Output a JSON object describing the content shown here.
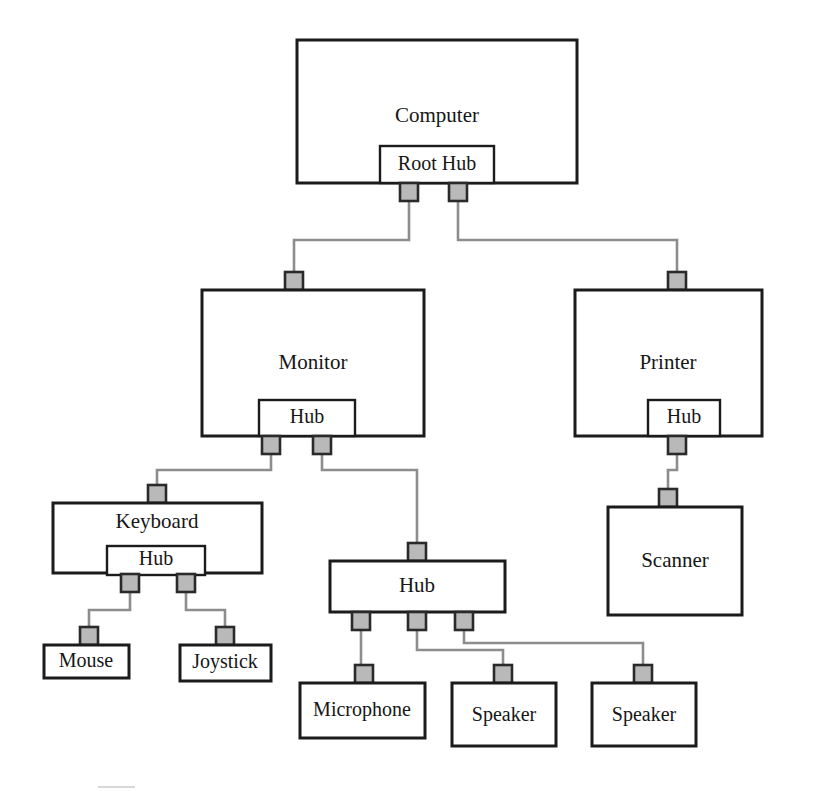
{
  "diagram": {
    "type": "usb-tiered-star-topology",
    "colors": {
      "box_stroke": "#1b1b1b",
      "box_fill": "#ffffff",
      "port_fill": "#b9b9b9",
      "port_stroke": "#2a2a2a",
      "wire": "#8d8d8d",
      "text": "#161616",
      "background": "#ffffff"
    },
    "nodes": [
      {
        "id": "computer",
        "label": "Computer",
        "tier": 0,
        "box": {
          "x": 297,
          "y": 40,
          "w": 280,
          "h": 143
        },
        "label_pos": {
          "x": 437,
          "y": 117
        },
        "hub": {
          "label": "Root Hub",
          "box": {
            "x": 380,
            "y": 146,
            "w": 114,
            "h": 37
          },
          "label_pos": {
            "x": 437,
            "y": 165
          }
        },
        "downstream_ports": [
          {
            "id": "root-hub-port-1",
            "x": 400,
            "y": 183
          },
          {
            "id": "root-hub-port-2",
            "x": 449,
            "y": 183
          }
        ]
      },
      {
        "id": "monitor",
        "label": "Monitor",
        "tier": 1,
        "box": {
          "x": 202,
          "y": 290,
          "w": 222,
          "h": 146
        },
        "label_pos": {
          "x": 313,
          "y": 364
        },
        "upstream_port": {
          "id": "monitor-upstream-port",
          "x": 285,
          "y": 272
        },
        "hub": {
          "label": "Hub",
          "box": {
            "x": 259,
            "y": 400,
            "w": 96,
            "h": 36
          },
          "label_pos": {
            "x": 307,
            "y": 418
          }
        },
        "downstream_ports": [
          {
            "id": "monitor-hub-port-1",
            "x": 262,
            "y": 436
          },
          {
            "id": "monitor-hub-port-2",
            "x": 313,
            "y": 436
          }
        ]
      },
      {
        "id": "printer",
        "label": "Printer",
        "tier": 1,
        "box": {
          "x": 575,
          "y": 290,
          "w": 187,
          "h": 146
        },
        "label_pos": {
          "x": 668,
          "y": 364
        },
        "upstream_port": {
          "id": "printer-upstream-port",
          "x": 668,
          "y": 272
        },
        "hub": {
          "label": "Hub",
          "box": {
            "x": 648,
            "y": 400,
            "w": 72,
            "h": 36
          },
          "label_pos": {
            "x": 684,
            "y": 418
          }
        },
        "downstream_ports": [
          {
            "id": "printer-hub-port-1",
            "x": 668,
            "y": 436
          }
        ]
      },
      {
        "id": "keyboard",
        "label": "Keyboard",
        "tier": 2,
        "box": {
          "x": 53,
          "y": 503,
          "w": 209,
          "h": 70
        },
        "label_pos": {
          "x": 157,
          "y": 523
        },
        "upstream_port": {
          "id": "keyboard-upstream-port",
          "x": 148,
          "y": 485
        },
        "hub": {
          "label": "Hub",
          "box": {
            "x": 107,
            "y": 546,
            "w": 98,
            "h": 29
          },
          "label_pos": {
            "x": 156,
            "y": 560
          }
        },
        "downstream_ports": [
          {
            "id": "keyboard-hub-port-1",
            "x": 121,
            "y": 574
          },
          {
            "id": "keyboard-hub-port-2",
            "x": 177,
            "y": 574
          }
        ]
      },
      {
        "id": "hub-standalone",
        "label": "Hub",
        "tier": 2,
        "box": {
          "x": 330,
          "y": 561,
          "w": 175,
          "h": 51
        },
        "label_pos": {
          "x": 417,
          "y": 587
        },
        "upstream_port": {
          "id": "hub-standalone-upstream-port",
          "x": 408,
          "y": 543
        },
        "downstream_ports": [
          {
            "id": "hub-standalone-port-1",
            "x": 352,
            "y": 612
          },
          {
            "id": "hub-standalone-port-2",
            "x": 408,
            "y": 612
          },
          {
            "id": "hub-standalone-port-3",
            "x": 455,
            "y": 612
          }
        ]
      },
      {
        "id": "scanner",
        "label": "Scanner",
        "tier": 2,
        "box": {
          "x": 608,
          "y": 507,
          "w": 134,
          "h": 108
        },
        "label_pos": {
          "x": 675,
          "y": 562
        },
        "upstream_port": {
          "id": "scanner-upstream-port",
          "x": 659,
          "y": 489
        }
      },
      {
        "id": "mouse",
        "label": "Mouse",
        "tier": 3,
        "box": {
          "x": 44,
          "y": 645,
          "w": 85,
          "h": 33
        },
        "label_pos": {
          "x": 86,
          "y": 662
        },
        "upstream_port": {
          "id": "mouse-upstream-port",
          "x": 80,
          "y": 627
        }
      },
      {
        "id": "joystick",
        "label": "Joystick",
        "tier": 3,
        "box": {
          "x": 180,
          "y": 645,
          "w": 91,
          "h": 36
        },
        "label_pos": {
          "x": 225,
          "y": 663
        },
        "upstream_port": {
          "id": "joystick-upstream-port",
          "x": 216,
          "y": 627
        }
      },
      {
        "id": "microphone",
        "label": "Microphone",
        "tier": 3,
        "box": {
          "x": 300,
          "y": 683,
          "w": 125,
          "h": 55
        },
        "label_pos": {
          "x": 362,
          "y": 711
        },
        "upstream_port": {
          "id": "microphone-upstream-port",
          "x": 355,
          "y": 665
        }
      },
      {
        "id": "speaker-1",
        "label": "Speaker",
        "tier": 3,
        "box": {
          "x": 452,
          "y": 683,
          "w": 104,
          "h": 63
        },
        "label_pos": {
          "x": 504,
          "y": 716
        },
        "upstream_port": {
          "id": "speaker-1-upstream-port",
          "x": 494,
          "y": 665
        }
      },
      {
        "id": "speaker-2",
        "label": "Speaker",
        "tier": 3,
        "box": {
          "x": 592,
          "y": 683,
          "w": 104,
          "h": 63
        },
        "label_pos": {
          "x": 644,
          "y": 716
        },
        "upstream_port": {
          "id": "speaker-2-upstream-port",
          "x": 634,
          "y": 665
        }
      }
    ],
    "connections": [
      {
        "id": "wire-roothub-to-monitor",
        "from": "root-hub-port-1",
        "to": "monitor-upstream-port",
        "path": "M 409 201 L 409 240 L 294 240 L 294 272"
      },
      {
        "id": "wire-roothub-to-printer",
        "from": "root-hub-port-2",
        "to": "printer-upstream-port",
        "path": "M 458 201 L 458 240 L 677 240 L 677 272"
      },
      {
        "id": "wire-monitorhub-to-keyboard",
        "from": "monitor-hub-port-1",
        "to": "keyboard-upstream-port",
        "path": "M 271 454 L 271 470 L 157 470 L 157 485"
      },
      {
        "id": "wire-monitorhub-to-hub",
        "from": "monitor-hub-port-2",
        "to": "hub-standalone-upstream-port",
        "path": "M 322 454 L 322 470 L 417 470 L 417 543"
      },
      {
        "id": "wire-printerhub-to-scanner",
        "from": "printer-hub-port-1",
        "to": "scanner-upstream-port",
        "path": "M 677 454 L 677 470 L 668 470 L 668 489"
      },
      {
        "id": "wire-keyboardhub-to-mouse",
        "from": "keyboard-hub-port-1",
        "to": "mouse-upstream-port",
        "path": "M 130 592 L 130 610 L 89 610 L 89 627"
      },
      {
        "id": "wire-keyboardhub-to-joystick",
        "from": "keyboard-hub-port-2",
        "to": "joystick-upstream-port",
        "path": "M 186 592 L 186 610 L 225 610 L 225 627"
      },
      {
        "id": "wire-hub-to-microphone",
        "from": "hub-standalone-port-1",
        "to": "microphone-upstream-port",
        "path": "M 361 630 L 361 665"
      },
      {
        "id": "wire-hub-to-speaker-1",
        "from": "hub-standalone-port-2",
        "to": "speaker-1-upstream-port",
        "path": "M 417 630 L 417 650 L 503 650 L 503 665"
      },
      {
        "id": "wire-hub-to-speaker-2",
        "from": "hub-standalone-port-3",
        "to": "speaker-2-upstream-port",
        "path": "M 464 630 L 464 643 L 643 643 L 643 665"
      }
    ],
    "port_size": 18
  }
}
